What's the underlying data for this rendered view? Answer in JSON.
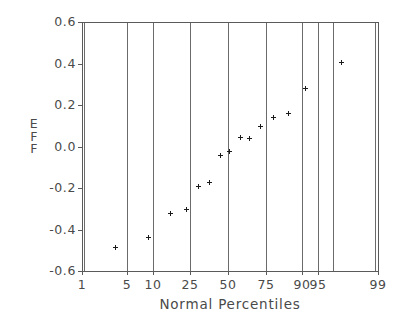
{
  "chart_data": {
    "type": "scatter",
    "title": "",
    "subtitle": "",
    "xlabel": "Normal Percentiles",
    "ylabel": "EFF",
    "ylabel_letters": [
      "E",
      "F",
      "F"
    ],
    "grid": "vertical-only",
    "legend": "none",
    "marker_style": "plus",
    "marker_color": "#1a1a1a",
    "axis_color": "#5a5a5a",
    "xscale": "normal-probability",
    "xlim": [
      1,
      99
    ],
    "ylim": [
      -0.6,
      0.6
    ],
    "xticks": [
      1,
      5,
      10,
      25,
      50,
      75,
      90,
      95,
      99
    ],
    "xtick_labels": [
      "1",
      "5",
      "10",
      "25",
      "50",
      "75",
      "90",
      "95",
      "99"
    ],
    "yticks": [
      -0.6,
      -0.4,
      -0.2,
      0.0,
      0.2,
      0.4,
      0.6
    ],
    "ytick_labels": [
      "-0.6",
      "-0.4",
      "-0.2",
      "0.0",
      "0.2",
      "0.4",
      "0.6"
    ],
    "points": [
      {
        "percentile": 3.5,
        "eff": -0.485
      },
      {
        "percentile": 10.0,
        "eff": -0.435
      },
      {
        "percentile": 17.5,
        "eff": -0.32
      },
      {
        "percentile": 24.5,
        "eff": -0.3
      },
      {
        "percentile": 30.5,
        "eff": -0.19
      },
      {
        "percentile": 37.0,
        "eff": -0.17
      },
      {
        "percentile": 43.5,
        "eff": -0.04
      },
      {
        "percentile": 49.5,
        "eff": -0.02
      },
      {
        "percentile": 56.5,
        "eff": 0.045
      },
      {
        "percentile": 62.0,
        "eff": 0.04
      },
      {
        "percentile": 68.0,
        "eff": 0.098
      },
      {
        "percentile": 75.0,
        "eff": 0.14
      },
      {
        "percentile": 82.0,
        "eff": 0.16
      },
      {
        "percentile": 88.0,
        "eff": 0.28
      },
      {
        "percentile": 96.0,
        "eff": 0.405
      }
    ]
  },
  "geometry": {
    "plot_left": 82,
    "plot_right": 378,
    "plot_top": 22,
    "plot_bottom": 271,
    "xtick_px": [
      82,
      127,
      153,
      190,
      228,
      266,
      302,
      318,
      378
    ],
    "gridline_px": [
      127,
      153,
      190,
      228,
      266,
      302,
      318
    ],
    "ytick_px": [
      271,
      229.5,
      188,
      146.5,
      105,
      63.5,
      22
    ]
  }
}
